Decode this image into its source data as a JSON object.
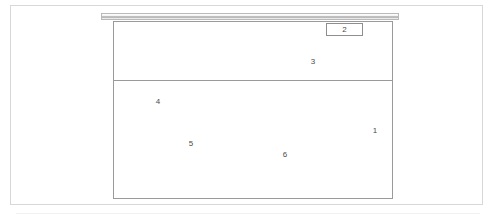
{
  "figure": {
    "type": "technical-line-drawing",
    "background_color": "#ffffff",
    "line_color": "#9a9a9a",
    "frame_color": "#d8d8d8",
    "label_color": "#4a4a4a",
    "reference_labels": [
      {
        "id": "1",
        "text": "1",
        "region": "lower-region-right-edge"
      },
      {
        "id": "2",
        "text": "2",
        "region": "callout-box-on-top-bar"
      },
      {
        "id": "3",
        "text": "3",
        "region": "upper-region"
      },
      {
        "id": "4",
        "text": "4",
        "region": "lower-region-upper-left"
      },
      {
        "id": "5",
        "text": "5",
        "region": "lower-region-middle-left"
      },
      {
        "id": "6",
        "text": "6",
        "region": "lower-region-middle"
      }
    ]
  },
  "elements": {
    "outer_frame_label": "",
    "top_bar_label": "",
    "main_box_label": "",
    "divider_label": ""
  }
}
